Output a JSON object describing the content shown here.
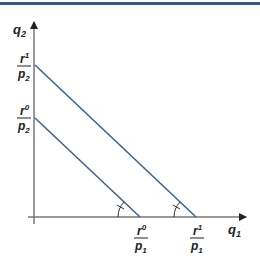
{
  "diagram": {
    "type": "budget-line-shift",
    "colors": {
      "top_bar": "#2f5b8a",
      "axes": "#777777",
      "budget_lines": "#3a6590",
      "text": "#222222"
    },
    "axes": {
      "y_label": {
        "base": "q",
        "sub": "2"
      },
      "x_label": {
        "base": "q",
        "sub": "1"
      }
    },
    "y_intercepts": [
      {
        "num_base": "r",
        "num_sup": "1",
        "den_base": "p",
        "den_sub": "2"
      },
      {
        "num_base": "r",
        "num_sup": "0",
        "den_base": "p",
        "den_sub": "2"
      }
    ],
    "x_intercepts": [
      {
        "num_base": "r",
        "num_sup": "0",
        "den_base": "p",
        "den_sub": "1"
      },
      {
        "num_base": "r",
        "num_sup": "1",
        "den_base": "p",
        "den_sub": "1"
      }
    ],
    "lines": [
      {
        "name": "budget-line-initial",
        "label": "r0"
      },
      {
        "name": "budget-line-new",
        "label": "r1"
      }
    ],
    "angle_marks": 2
  }
}
